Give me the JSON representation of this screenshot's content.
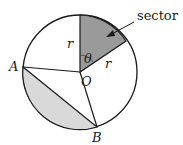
{
  "diagram": {
    "labels": {
      "sector": "sector",
      "radius_top": "r",
      "radius_side": "r",
      "angle": "θ",
      "center": "O",
      "point_a": "A",
      "point_b": "B"
    },
    "colors": {
      "sector_fill": "#9a9a9a",
      "segment_fill": "#d9d9d9",
      "stroke": "#1a1a1a"
    }
  }
}
